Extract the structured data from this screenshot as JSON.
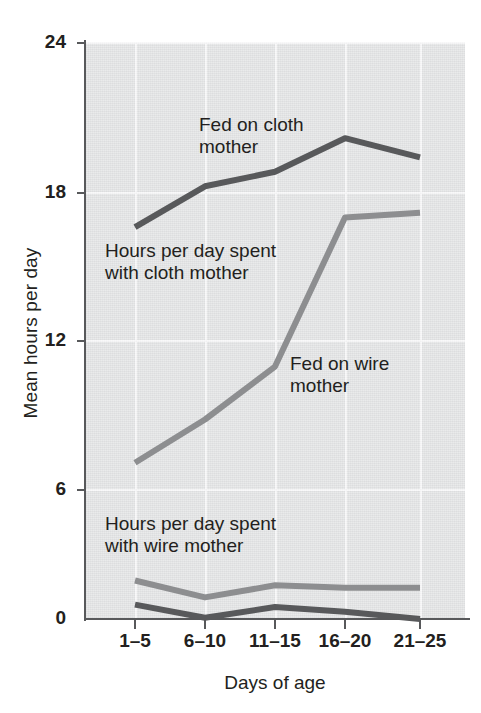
{
  "chart_data": {
    "type": "line",
    "title": "",
    "xlabel": "Days of age",
    "ylabel": "Mean hours per day",
    "categories": [
      "1–5",
      "6–10",
      "11–15",
      "16–20",
      "21–25"
    ],
    "ylim": [
      0,
      25
    ],
    "yticks": [
      0,
      6,
      12,
      18,
      24
    ],
    "ytick_labels": [
      "0",
      "6",
      "12",
      "18",
      "24"
    ],
    "grid": true,
    "legend_position": "inline-annotations",
    "series": [
      {
        "name": "Fed on cloth mother",
        "color": "#58595b",
        "values": [
          16.3,
          18.0,
          18.6,
          20.0,
          19.2
        ]
      },
      {
        "name": "Hours per day spent with cloth mother",
        "color": "#8d8e90",
        "values": [
          6.5,
          8.3,
          10.5,
          16.7,
          16.9
        ]
      },
      {
        "name": "Hours per day spent with wire mother",
        "color": "#8d8e90",
        "values": [
          1.6,
          0.9,
          1.4,
          1.3,
          1.3
        ]
      },
      {
        "name": "Fed on wire mother",
        "color": "#58595b",
        "values": [
          0.6,
          0.05,
          0.5,
          0.3,
          0.0
        ]
      }
    ],
    "annotations": [
      {
        "text": "Fed on cloth\nmother",
        "series": "Fed on cloth mother"
      },
      {
        "text": "Hours per day spent\nwith cloth mother",
        "series": "Hours per day spent with cloth mother"
      },
      {
        "text": "Fed on wire\nmother",
        "series": "Fed on wire mother"
      },
      {
        "text": "Hours per day spent\nwith wire mother",
        "series": "Hours per day spent with wire mother"
      }
    ],
    "colors": {
      "plot_background": "#e2e3e4",
      "gridline": "#f7f7f8",
      "axis": "#58595b",
      "dark_series": "#58595b",
      "light_series": "#8d8e90",
      "text": "#231f20"
    }
  }
}
